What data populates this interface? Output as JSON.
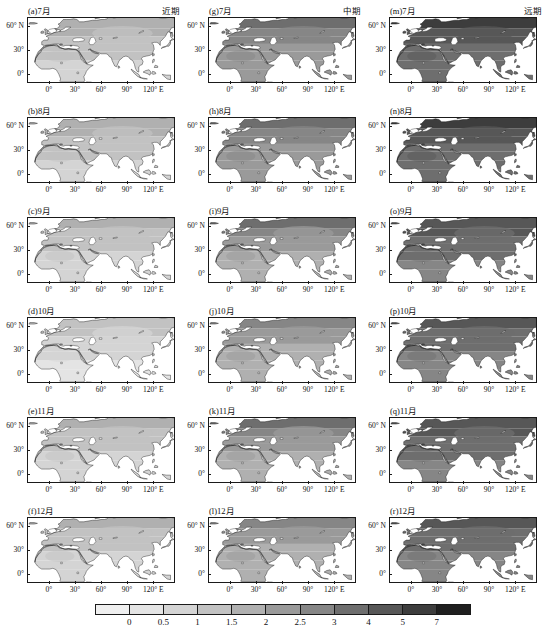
{
  "figure": {
    "columns": [
      {
        "id": "near",
        "header": "近期"
      },
      {
        "id": "mid",
        "header": "中期"
      },
      {
        "id": "far",
        "header": "远期"
      }
    ],
    "panels": [
      {
        "label": "(a)7月",
        "column": "near",
        "row": 0,
        "month": "7月",
        "period": "近期"
      },
      {
        "label": "(b)8月",
        "column": "near",
        "row": 1,
        "month": "8月",
        "period": "近期"
      },
      {
        "label": "(c)9月",
        "column": "near",
        "row": 2,
        "month": "9月",
        "period": "近期"
      },
      {
        "label": "(d)10月",
        "column": "near",
        "row": 3,
        "month": "10月",
        "period": "近期"
      },
      {
        "label": "(e)11月",
        "column": "near",
        "row": 4,
        "month": "11月",
        "period": "近期"
      },
      {
        "label": "(f)12月",
        "column": "near",
        "row": 5,
        "month": "12月",
        "period": "近期"
      },
      {
        "label": "(g)7月",
        "column": "mid",
        "row": 0,
        "month": "7月",
        "period": "中期"
      },
      {
        "label": "(h)8月",
        "column": "mid",
        "row": 1,
        "month": "8月",
        "period": "中期"
      },
      {
        "label": "(i)9月",
        "column": "mid",
        "row": 2,
        "month": "9月",
        "period": "中期"
      },
      {
        "label": "(j)10月",
        "column": "mid",
        "row": 3,
        "month": "10月",
        "period": "中期"
      },
      {
        "label": "(k)11月",
        "column": "mid",
        "row": 4,
        "month": "11月",
        "period": "中期"
      },
      {
        "label": "(l)12月",
        "column": "mid",
        "row": 5,
        "month": "12月",
        "period": "中期"
      },
      {
        "label": "(m)7月",
        "column": "far",
        "row": 0,
        "month": "7月",
        "period": "远期"
      },
      {
        "label": "(n)8月",
        "column": "far",
        "row": 1,
        "month": "8月",
        "period": "远期"
      },
      {
        "label": "(o)9月",
        "column": "far",
        "row": 2,
        "month": "9月",
        "period": "远期"
      },
      {
        "label": "(p)10月",
        "column": "far",
        "row": 3,
        "month": "10月",
        "period": "远期"
      },
      {
        "label": "(q)11月",
        "column": "far",
        "row": 4,
        "month": "11月",
        "period": "远期"
      },
      {
        "label": "(r)12月",
        "column": "far",
        "row": 5,
        "month": "12月",
        "period": "远期"
      }
    ]
  },
  "axes": {
    "ylabels": [
      "60° N",
      "30°",
      "0°"
    ],
    "yvalues": [
      60,
      30,
      0
    ],
    "xlabels": [
      "0°",
      "30°",
      "60°",
      "90°",
      "120° E"
    ],
    "xvalues": [
      0,
      30,
      60,
      90,
      120
    ],
    "lon_range": [
      -25,
      145
    ],
    "lat_range": [
      -12,
      72
    ]
  },
  "chart_data": {
    "type": "heatmap",
    "title": "",
    "subtitle": "",
    "xlabel": "",
    "ylabel": "",
    "grid": false,
    "legend_position": "bottom",
    "colorbar": {
      "orientation": "horizontal",
      "tick_labels": [
        "0",
        "0.5",
        "1",
        "1.5",
        "2",
        "2.5",
        "3",
        "4",
        "5",
        "7"
      ],
      "tick_values": [
        0,
        0.5,
        1,
        1.5,
        2,
        2.5,
        3,
        4,
        5,
        7
      ],
      "segment_colors": [
        "#efefef",
        "#e4e4e4",
        "#d4d4d4",
        "#c2c2c2",
        "#b0b0b0",
        "#9a9a9a",
        "#868686",
        "#6e6e6e",
        "#575757",
        "#3d3d3d",
        "#1f1f1f"
      ],
      "segment_count": 11
    },
    "panel_levels": [
      {
        "panel": "(a)7月",
        "dominant": 1.0,
        "range": [
          0.5,
          2.0
        ]
      },
      {
        "panel": "(b)8月",
        "dominant": 1.0,
        "range": [
          0.5,
          2.0
        ]
      },
      {
        "panel": "(c)9月",
        "dominant": 1.0,
        "range": [
          0.5,
          1.5
        ]
      },
      {
        "panel": "(d)10月",
        "dominant": 0.5,
        "range": [
          0.0,
          1.5
        ]
      },
      {
        "panel": "(e)11月",
        "dominant": 1.0,
        "range": [
          0.5,
          1.5
        ]
      },
      {
        "panel": "(f)12月",
        "dominant": 1.0,
        "range": [
          0.5,
          1.5
        ]
      },
      {
        "panel": "(g)7月",
        "dominant": 2.5,
        "range": [
          1.5,
          3.0
        ]
      },
      {
        "panel": "(h)8月",
        "dominant": 2.5,
        "range": [
          1.5,
          3.0
        ]
      },
      {
        "panel": "(i)9月",
        "dominant": 2.0,
        "range": [
          1.0,
          3.0
        ]
      },
      {
        "panel": "(j)10月",
        "dominant": 2.0,
        "range": [
          1.0,
          2.5
        ]
      },
      {
        "panel": "(k)11月",
        "dominant": 2.0,
        "range": [
          1.0,
          3.0
        ]
      },
      {
        "panel": "(l)12月",
        "dominant": 2.0,
        "range": [
          1.0,
          2.5
        ]
      },
      {
        "panel": "(m)7月",
        "dominant": 4.0,
        "range": [
          2.5,
          5.0
        ]
      },
      {
        "panel": "(n)8月",
        "dominant": 4.0,
        "range": [
          2.5,
          5.0
        ]
      },
      {
        "panel": "(o)9月",
        "dominant": 3.0,
        "range": [
          2.0,
          5.0
        ]
      },
      {
        "panel": "(p)10月",
        "dominant": 3.0,
        "range": [
          2.0,
          4.0
        ]
      },
      {
        "panel": "(q)11月",
        "dominant": 3.0,
        "range": [
          2.0,
          5.0
        ]
      },
      {
        "panel": "(r)12月",
        "dominant": 3.0,
        "range": [
          2.0,
          4.0
        ]
      }
    ]
  }
}
